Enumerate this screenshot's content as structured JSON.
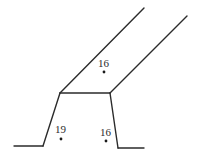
{
  "diagram": {
    "type": "cross-section-sketch",
    "stroke_color": "#2b2b2b",
    "background": "#ffffff",
    "segments": [
      {
        "name": "left-floor",
        "x1": 14,
        "y1": 146,
        "x2": 43,
        "y2": 146
      },
      {
        "name": "left-slope",
        "x1": 43,
        "y1": 146,
        "x2": 60,
        "y2": 93
      },
      {
        "name": "top-edge",
        "x1": 60,
        "y1": 93,
        "x2": 110,
        "y2": 93
      },
      {
        "name": "right-slope",
        "x1": 110,
        "y1": 93,
        "x2": 118,
        "y2": 148
      },
      {
        "name": "right-floor",
        "x1": 118,
        "y1": 148,
        "x2": 144,
        "y2": 148
      },
      {
        "name": "upper-left-diagonal",
        "x1": 60,
        "y1": 93,
        "x2": 144,
        "y2": 8
      },
      {
        "name": "upper-right-diagonal",
        "x1": 110,
        "y1": 93,
        "x2": 187,
        "y2": 16
      }
    ],
    "points": [
      {
        "name": "point-upper",
        "label": "16",
        "x": 104,
        "y": 72,
        "label_x": 98,
        "label_y": 67
      },
      {
        "name": "point-lower-left",
        "label": "19",
        "x": 61,
        "y": 139,
        "label_x": 55,
        "label_y": 133
      },
      {
        "name": "point-lower-right",
        "label": "16",
        "x": 106,
        "y": 141,
        "label_x": 100,
        "label_y": 136
      }
    ]
  }
}
